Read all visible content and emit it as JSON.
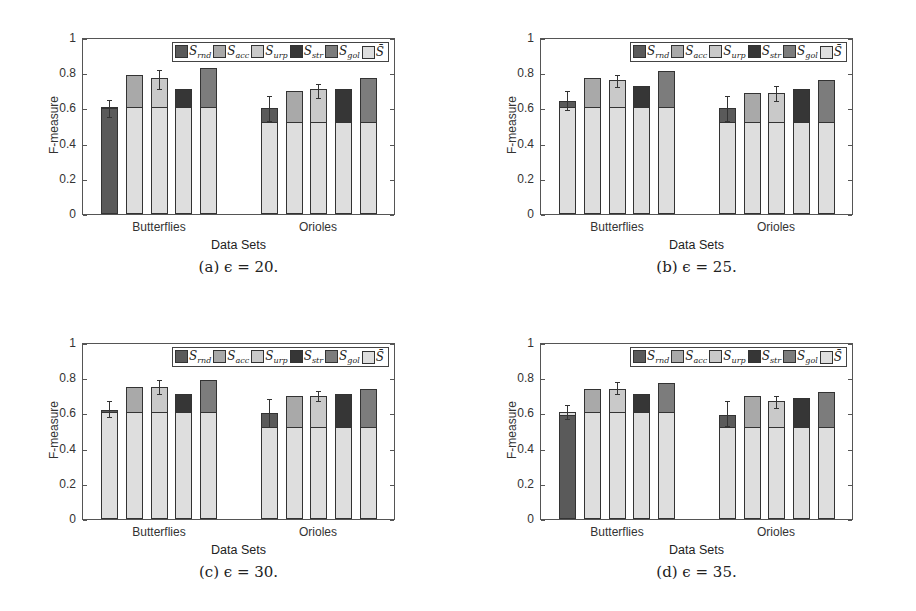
{
  "legend": [
    {
      "key": "rnd",
      "label": "S",
      "sub": "rnd",
      "color": "#5a5a5a"
    },
    {
      "key": "acc",
      "label": "S",
      "sub": "acc",
      "color": "#a9a9a9"
    },
    {
      "key": "urp",
      "label": "S",
      "sub": "urp",
      "color": "#c9c9c9"
    },
    {
      "key": "str",
      "label": "S",
      "sub": "str",
      "color": "#363636"
    },
    {
      "key": "gol",
      "label": "S",
      "sub": "gol",
      "color": "#7c7c7c"
    },
    {
      "key": "bar",
      "label": "S̄",
      "sub": "",
      "color": "#dedede"
    }
  ],
  "chart_data": [
    {
      "type": "bar",
      "stacked": true,
      "caption": "(a) ϵ = 20.",
      "title": "",
      "xlabel": "Data Sets",
      "ylabel": "F-measure",
      "ylim": [
        0,
        1
      ],
      "yticks": [
        "0",
        "0.2",
        "0.4",
        "0.6",
        "0.8",
        "1"
      ],
      "categories": [
        "Butterflies",
        "Orioles"
      ],
      "groups": [
        {
          "name": "Butterflies",
          "bars": [
            {
              "series": "rnd",
              "base": 0.0,
              "base_series": "rnd",
              "value": 0.6,
              "cap": 0.61,
              "err": [
                0.55,
                0.65
              ]
            },
            {
              "series": "acc",
              "base": 0.61,
              "value": 0.79
            },
            {
              "series": "urp",
              "base": 0.61,
              "value": 0.77,
              "err": [
                0.71,
                0.82
              ]
            },
            {
              "series": "str",
              "base": 0.61,
              "value": 0.71
            },
            {
              "series": "gol",
              "base": 0.61,
              "value": 0.83
            }
          ]
        },
        {
          "name": "Orioles",
          "bars": [
            {
              "series": "rnd",
              "base": 0.525,
              "value": 0.6,
              "err": [
                0.53,
                0.67
              ]
            },
            {
              "series": "acc",
              "base": 0.525,
              "value": 0.7
            },
            {
              "series": "urp",
              "base": 0.525,
              "value": 0.71,
              "err": [
                0.66,
                0.74
              ]
            },
            {
              "series": "str",
              "base": 0.525,
              "value": 0.71
            },
            {
              "series": "gol",
              "base": 0.525,
              "value": 0.77
            }
          ]
        }
      ]
    },
    {
      "type": "bar",
      "stacked": true,
      "caption": "(b) ϵ = 25.",
      "title": "",
      "xlabel": "Data Sets",
      "ylabel": "F-measure",
      "ylim": [
        0,
        1
      ],
      "yticks": [
        "0",
        "0.2",
        "0.4",
        "0.6",
        "0.8",
        "1"
      ],
      "categories": [
        "Butterflies",
        "Orioles"
      ],
      "groups": [
        {
          "name": "Butterflies",
          "bars": [
            {
              "series": "rnd",
              "base": 0.61,
              "value": 0.64,
              "err": [
                0.59,
                0.7
              ]
            },
            {
              "series": "acc",
              "base": 0.61,
              "value": 0.77
            },
            {
              "series": "urp",
              "base": 0.61,
              "value": 0.76,
              "err": [
                0.72,
                0.79
              ]
            },
            {
              "series": "str",
              "base": 0.61,
              "value": 0.73
            },
            {
              "series": "gol",
              "base": 0.61,
              "value": 0.81
            }
          ]
        },
        {
          "name": "Orioles",
          "bars": [
            {
              "series": "rnd",
              "base": 0.525,
              "value": 0.6,
              "err": [
                0.53,
                0.67
              ]
            },
            {
              "series": "acc",
              "base": 0.525,
              "value": 0.69
            },
            {
              "series": "urp",
              "base": 0.525,
              "value": 0.69,
              "err": [
                0.64,
                0.73
              ]
            },
            {
              "series": "str",
              "base": 0.525,
              "value": 0.71
            },
            {
              "series": "gol",
              "base": 0.525,
              "value": 0.76
            }
          ]
        }
      ]
    },
    {
      "type": "bar",
      "stacked": true,
      "caption": "(c) ϵ = 30.",
      "title": "",
      "xlabel": "Data Sets",
      "ylabel": "F-measure",
      "ylim": [
        0,
        1
      ],
      "yticks": [
        "0",
        "0.2",
        "0.4",
        "0.6",
        "0.8",
        "1"
      ],
      "categories": [
        "Butterflies",
        "Orioles"
      ],
      "groups": [
        {
          "name": "Butterflies",
          "bars": [
            {
              "series": "rnd",
              "base": 0.61,
              "value": 0.62,
              "err": [
                0.58,
                0.67
              ]
            },
            {
              "series": "acc",
              "base": 0.61,
              "value": 0.75
            },
            {
              "series": "urp",
              "base": 0.61,
              "value": 0.75,
              "err": [
                0.71,
                0.79
              ]
            },
            {
              "series": "str",
              "base": 0.61,
              "value": 0.71
            },
            {
              "series": "gol",
              "base": 0.61,
              "value": 0.79
            }
          ]
        },
        {
          "name": "Orioles",
          "bars": [
            {
              "series": "rnd",
              "base": 0.525,
              "value": 0.6,
              "err": [
                0.52,
                0.68
              ]
            },
            {
              "series": "acc",
              "base": 0.525,
              "value": 0.7
            },
            {
              "series": "urp",
              "base": 0.525,
              "value": 0.7,
              "err": [
                0.67,
                0.73
              ]
            },
            {
              "series": "str",
              "base": 0.525,
              "value": 0.71
            },
            {
              "series": "gol",
              "base": 0.525,
              "value": 0.74
            }
          ]
        }
      ]
    },
    {
      "type": "bar",
      "stacked": true,
      "caption": "(d) ϵ = 35.",
      "title": "",
      "xlabel": "Data Sets",
      "ylabel": "F-measure",
      "ylim": [
        0,
        1
      ],
      "yticks": [
        "0",
        "0.2",
        "0.4",
        "0.6",
        "0.8",
        "1"
      ],
      "categories": [
        "Butterflies",
        "Orioles"
      ],
      "groups": [
        {
          "name": "Butterflies",
          "bars": [
            {
              "series": "rnd",
              "base": 0.0,
              "base_series": "rnd",
              "value": 0.59,
              "cap": 0.61,
              "err": [
                0.57,
                0.65
              ]
            },
            {
              "series": "acc",
              "base": 0.61,
              "value": 0.74
            },
            {
              "series": "urp",
              "base": 0.61,
              "value": 0.74,
              "err": [
                0.71,
                0.78
              ]
            },
            {
              "series": "str",
              "base": 0.61,
              "value": 0.71
            },
            {
              "series": "gol",
              "base": 0.61,
              "value": 0.77
            }
          ]
        },
        {
          "name": "Orioles",
          "bars": [
            {
              "series": "rnd",
              "base": 0.525,
              "value": 0.59,
              "err": [
                0.53,
                0.67
              ]
            },
            {
              "series": "acc",
              "base": 0.525,
              "value": 0.7
            },
            {
              "series": "urp",
              "base": 0.525,
              "value": 0.67,
              "err": [
                0.63,
                0.7
              ]
            },
            {
              "series": "str",
              "base": 0.525,
              "value": 0.69
            },
            {
              "series": "gol",
              "base": 0.525,
              "value": 0.72
            }
          ]
        }
      ]
    }
  ]
}
